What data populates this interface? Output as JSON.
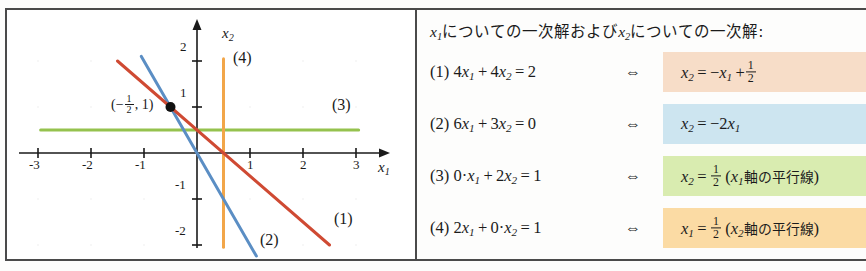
{
  "chart_data": {
    "type": "line",
    "title": "",
    "xlabel": "x1",
    "ylabel": "x2",
    "xlim": [
      -3.4,
      3.4
    ],
    "ylim": [
      -2.35,
      2.35
    ],
    "x_ticks": [
      "-3",
      "-2",
      "-1",
      "1",
      "2",
      "3"
    ],
    "x_tick_values": [
      -3,
      -2,
      -1,
      1,
      2,
      3
    ],
    "y_ticks": [
      "2",
      "1",
      "-1",
      "-2"
    ],
    "y_tick_values": [
      2,
      1,
      -1,
      -2
    ],
    "grid": false,
    "legend": "inline-labels",
    "annotations": [
      {
        "name": "intersection-point",
        "label_num": "-",
        "label_frac_num": "1",
        "label_frac_den": "2",
        "label_tail": ", 1)",
        "x": -0.5,
        "y": 1.0
      }
    ],
    "series": [
      {
        "name": "(1)",
        "label": "(1)",
        "color": "#cf4a33",
        "equation": "x2 = -x1 + 1/2",
        "slope": -1,
        "intercept": 0.5,
        "x_range": [
          -1.5,
          2.5
        ],
        "label_pos": {
          "x": 2.35,
          "y": -1.25
        }
      },
      {
        "name": "(2)",
        "label": "(2)",
        "color": "#5b8ec4",
        "equation": "x2 = -2x1",
        "slope": -2,
        "intercept": 0,
        "x_range": [
          -1.05,
          1.12
        ],
        "label_pos": {
          "x": 1.2,
          "y": -1.78
        }
      },
      {
        "name": "(3)",
        "label": "(3)",
        "color": "#95c24e",
        "equation": "x2 = 1/2",
        "slope": 0,
        "intercept": 0.5,
        "x_range": [
          -2.95,
          3.05
        ],
        "label_pos": {
          "x": 2.55,
          "y": 0.95
        }
      },
      {
        "name": "(4)",
        "label": "(4)",
        "color": "#f2a649",
        "equation": "x1 = 1/2",
        "vertical_x": 0.5,
        "y_range": [
          -2.05,
          2.05
        ],
        "label_pos": {
          "x": 0.95,
          "y": 1.62
        }
      }
    ]
  },
  "chart_labels": {
    "x_axis_name": "x",
    "x_axis_sub": "1",
    "y_axis_name": "x",
    "y_axis_sub": "2",
    "point_open": "(",
    "point_minus": "−",
    "point_num": "1",
    "point_den": "2",
    "point_rest": ", 1)"
  },
  "equations": {
    "header": {
      "part1_var": "x",
      "part1_sub": "1",
      "part1_text": "についての一次解および",
      "part2_var": "x",
      "part2_sub": "2",
      "part2_text": "についての一次解:"
    },
    "iff_symbol": "⇔",
    "rows": [
      {
        "index": "(1)",
        "lhs_plain": "4x1 + 4x2 = 2",
        "rhs_plain": "x2 = −x1 + 1/2",
        "band_color": "#f7ddc8",
        "lhs": {
          "c1": "4",
          "v1": "x",
          "s1": "1",
          "op": "+",
          "c2": "4",
          "v2": "x",
          "s2": "2",
          "eq": "=",
          "rv": "2"
        },
        "rhs": {
          "lv": "x",
          "lsub": "2",
          "eq": "=",
          "sign": "−",
          "rv": "x",
          "rsub": "1",
          "op": "+",
          "frac_num": "1",
          "frac_den": "2",
          "note": ""
        }
      },
      {
        "index": "(2)",
        "lhs_plain": "6x1 + 3x2 = 0",
        "rhs_plain": "x2 = −2x1",
        "band_color": "#cde5f0",
        "lhs": {
          "c1": "6",
          "v1": "x",
          "s1": "1",
          "op": "+",
          "c2": "3",
          "v2": "x",
          "s2": "2",
          "eq": "=",
          "rv": "0"
        },
        "rhs": {
          "lv": "x",
          "lsub": "2",
          "eq": "=",
          "sign": "−",
          "coef": "2",
          "rv": "x",
          "rsub": "1",
          "note": ""
        }
      },
      {
        "index": "(3)",
        "lhs_plain": "0·x1 + 2x2 = 1",
        "rhs_plain": "x2 = 1/2 (x1軸の平行線)",
        "band_color": "#d9ecb0",
        "lhs": {
          "c1": "0·",
          "v1": "x",
          "s1": "1",
          "op": "+",
          "c2": "2",
          "v2": "x",
          "s2": "2",
          "eq": "=",
          "rv": "1"
        },
        "rhs": {
          "lv": "x",
          "lsub": "2",
          "eq": "=",
          "frac_num": "1",
          "frac_den": "2",
          "note_open": "(",
          "note_var": "x",
          "note_sub": "1",
          "note_text": "軸の平行線",
          "note_close": ")"
        }
      },
      {
        "index": "(4)",
        "lhs_plain": "2x1 + 0·x2 = 1",
        "rhs_plain": "x1 = 1/2 (x2軸の平行線)",
        "band_color": "#fbdba4",
        "lhs": {
          "c1": "2",
          "v1": "x",
          "s1": "1",
          "op": "+",
          "c2": "0·",
          "v2": "x",
          "s2": "2",
          "eq": "=",
          "rv": "1"
        },
        "rhs": {
          "lv": "x",
          "lsub": "1",
          "eq": "=",
          "frac_num": "1",
          "frac_den": "2",
          "note_open": "(",
          "note_var": "x",
          "note_sub": "2",
          "note_text": "軸の平行線",
          "note_close": ")"
        }
      }
    ]
  },
  "colors": {
    "frame": "#4a4a4a",
    "axis": "#1a1a1a",
    "line1_red": "#cf4a33",
    "line2_blue": "#5b8ec4",
    "line3_green": "#95c24e",
    "line4_orange": "#f2a649",
    "point": "#111111"
  }
}
